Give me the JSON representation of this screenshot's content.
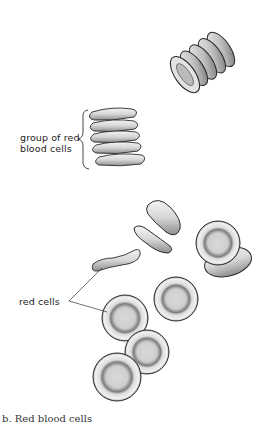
{
  "figure": {
    "labels": {
      "group": [
        "group of red",
        "blood cells"
      ],
      "red_cells": "red cells"
    },
    "caption": "b. Red blood cells",
    "colors": {
      "outline": "#2a2a2a",
      "cell_fill": "#e6e6e6",
      "cell_center": "#cfcfcf",
      "shadow": "#8a8a8a"
    }
  }
}
